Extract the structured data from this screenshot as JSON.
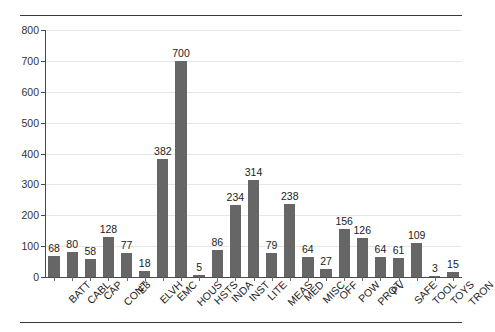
{
  "chart_data": {
    "type": "bar",
    "title": "",
    "subtitle": "",
    "xlabel": "",
    "ylabel": "",
    "ylim": [
      0,
      800
    ],
    "yticks": [
      0,
      100,
      200,
      300,
      400,
      500,
      600,
      700,
      800
    ],
    "grid": true,
    "legend": null,
    "bar_color": "#666666",
    "show_value_labels": true,
    "categories": [
      "BATT",
      "CABL",
      "CAP",
      "CONT",
      "E3",
      "ELVH",
      "EMC",
      "HOUS",
      "HSTS",
      "INDA",
      "INST",
      "LITE",
      "MEAS",
      "MED",
      "MISC",
      "OFF",
      "POW",
      "PROT",
      "PV",
      "SAFE",
      "TOOL",
      "TOYS",
      "TRON"
    ],
    "values": [
      68,
      80,
      58,
      128,
      77,
      18,
      382,
      700,
      5,
      86,
      234,
      314,
      79,
      238,
      64,
      27,
      156,
      126,
      64,
      61,
      109,
      3,
      15
    ]
  }
}
